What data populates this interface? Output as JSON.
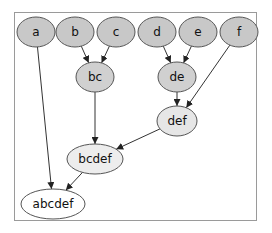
{
  "diagram": {
    "type": "tree-merge-graph",
    "frame": {
      "x": 14,
      "y": 12,
      "w": 243,
      "h": 209,
      "stroke": "#9a9a9a"
    },
    "colors": {
      "leaf_fill": "#c8c8c8",
      "mid_fill": "#d8d8d8",
      "light_fill": "#ececec",
      "root_fill": "#ffffff",
      "stroke": "#555555",
      "edge": "#333333"
    },
    "nodes": [
      {
        "id": "a",
        "label": "a",
        "cx": 36,
        "cy": 32,
        "rx": 19,
        "ry": 15,
        "fill": "#c8c8c8"
      },
      {
        "id": "b",
        "label": "b",
        "cx": 75,
        "cy": 32,
        "rx": 19,
        "ry": 15,
        "fill": "#c8c8c8"
      },
      {
        "id": "c",
        "label": "c",
        "cx": 116,
        "cy": 32,
        "rx": 19,
        "ry": 15,
        "fill": "#c8c8c8"
      },
      {
        "id": "d",
        "label": "d",
        "cx": 157,
        "cy": 32,
        "rx": 19,
        "ry": 15,
        "fill": "#c8c8c8"
      },
      {
        "id": "e",
        "label": "e",
        "cx": 198,
        "cy": 32,
        "rx": 19,
        "ry": 15,
        "fill": "#c8c8c8"
      },
      {
        "id": "f",
        "label": "f",
        "cx": 239,
        "cy": 32,
        "rx": 19,
        "ry": 15,
        "fill": "#c8c8c8"
      },
      {
        "id": "bc",
        "label": "bc",
        "cx": 95,
        "cy": 77,
        "rx": 19,
        "ry": 15,
        "fill": "#d0d0d0"
      },
      {
        "id": "de",
        "label": "de",
        "cx": 177,
        "cy": 77,
        "rx": 19,
        "ry": 15,
        "fill": "#d0d0d0"
      },
      {
        "id": "def",
        "label": "def",
        "cx": 177,
        "cy": 121,
        "rx": 20,
        "ry": 15,
        "fill": "#e6e6e6"
      },
      {
        "id": "bcdef",
        "label": "bcdef",
        "cx": 95,
        "cy": 159,
        "rx": 28,
        "ry": 15,
        "fill": "#ededed"
      },
      {
        "id": "abcdef",
        "label": "abcdef",
        "cx": 53,
        "cy": 204,
        "rx": 32,
        "ry": 15,
        "fill": "#ffffff"
      }
    ],
    "edges": [
      {
        "from": "a",
        "to": "abcdef"
      },
      {
        "from": "b",
        "to": "bc"
      },
      {
        "from": "c",
        "to": "bc"
      },
      {
        "from": "d",
        "to": "de"
      },
      {
        "from": "e",
        "to": "de"
      },
      {
        "from": "f",
        "to": "def"
      },
      {
        "from": "bc",
        "to": "bcdef"
      },
      {
        "from": "de",
        "to": "def"
      },
      {
        "from": "def",
        "to": "bcdef"
      },
      {
        "from": "bcdef",
        "to": "abcdef"
      }
    ]
  }
}
